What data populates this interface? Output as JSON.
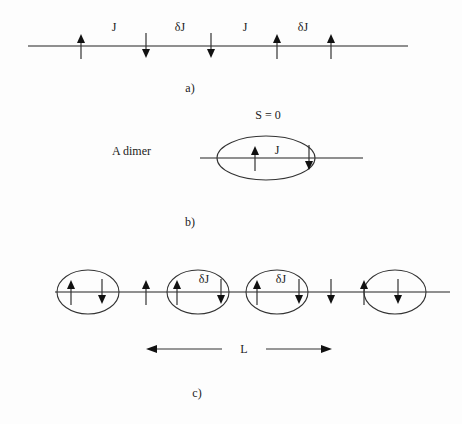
{
  "panels": {
    "a": {
      "caption": "a)",
      "spins": [
        "up",
        "down",
        "down",
        "up",
        "up"
      ],
      "bond_labels": [
        "J",
        "δJ",
        "J",
        "δJ"
      ]
    },
    "b": {
      "caption": "b)",
      "title": "A dimer",
      "total_spin_label": "S = 0",
      "spins": [
        "up",
        "down"
      ],
      "bond_label": "J"
    },
    "c": {
      "caption": "c)",
      "spins": [
        "up",
        "down",
        "up",
        "up",
        "down",
        "up",
        "down",
        "down",
        "up",
        "down"
      ],
      "dimer_pairs": [
        [
          0,
          1
        ],
        [
          3,
          4
        ],
        [
          5,
          6
        ],
        [
          8,
          9
        ]
      ],
      "bond_labels": [
        "δJ",
        "δJ"
      ],
      "length_label": "L"
    }
  }
}
